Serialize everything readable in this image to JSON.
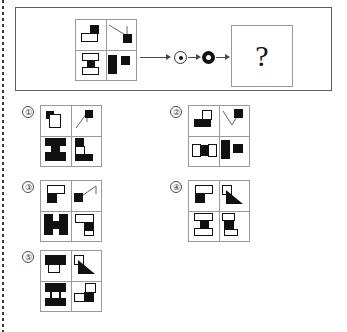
{
  "problem": {
    "panel_name": "problem-panel",
    "answer_placeholder": "?",
    "operators": [
      {
        "name": "ring-dot-icon",
        "label": "ring-dot"
      },
      {
        "name": "filled-disc-icon",
        "label": "filled-disc"
      }
    ],
    "figure": {
      "name": "main-figure",
      "quadrants": [
        {
          "position": "top-left",
          "description": "small black square upper-right over white outlined rectangle"
        },
        {
          "position": "top-right",
          "description": "thin diagonal line descending left-to-right with black square at lower right"
        },
        {
          "position": "bottom-left",
          "description": "white outlined rectangle, black square, white outlined rectangle stacked vertically"
        },
        {
          "position": "bottom-right",
          "description": "tall black rectangle at left with black square at upper right"
        }
      ]
    }
  },
  "options": [
    {
      "number": "①",
      "name": "option-1",
      "quadrants": [
        {
          "position": "top-left",
          "description": "small black square upper-left over white outlined rectangle"
        },
        {
          "position": "top-right",
          "description": "thin diagonal line rising with black square at top right"
        },
        {
          "position": "bottom-left",
          "description": "black I-shape, wide black bars top and bottom with black stem"
        },
        {
          "position": "bottom-right",
          "description": "black square over white rectangle with black bar at bottom right"
        }
      ]
    },
    {
      "number": "②",
      "name": "option-2",
      "quadrants": [
        {
          "position": "top-left",
          "description": "white outlined square upper-right over wide black rectangle"
        },
        {
          "position": "top-right",
          "description": "thin diagonal line descending with black square at top right"
        },
        {
          "position": "bottom-left",
          "description": "white rectangle, black square, white rectangle side by side horizontally"
        },
        {
          "position": "bottom-right",
          "description": "tall black rectangle at left with black square at right"
        }
      ]
    },
    {
      "number": "③",
      "name": "option-3",
      "quadrants": [
        {
          "position": "top-left",
          "description": "white outlined rectangle upper-right over black square"
        },
        {
          "position": "top-right",
          "description": "black square at left with thin diagonal line rising to the right"
        },
        {
          "position": "bottom-left",
          "description": "black H-shape, thick black blocks joined by black bar"
        },
        {
          "position": "bottom-right",
          "description": "white outlined rectangle with black square below right"
        }
      ]
    },
    {
      "number": "④",
      "name": "option-4",
      "quadrants": [
        {
          "position": "top-left",
          "description": "white outlined rectangle upper-right over black square"
        },
        {
          "position": "top-right",
          "description": "white outlined square upper-left with black right triangle"
        },
        {
          "position": "bottom-left",
          "description": "white rectangle, black square, white rectangle stacked vertically"
        },
        {
          "position": "bottom-right",
          "description": "white rectangle top, black square middle, white rectangle bottom offset"
        }
      ]
    },
    {
      "number": "⑤",
      "name": "option-5",
      "quadrants": [
        {
          "position": "top-left",
          "description": "wide black rectangle over white outlined rectangle"
        },
        {
          "position": "top-right",
          "description": "white outlined square upper-left with black right triangle"
        },
        {
          "position": "bottom-left",
          "description": "wide black rectangle top, black bar bottom joined by thin stems"
        },
        {
          "position": "bottom-right",
          "description": "white rectangle upper right, black square with white rectangle at lower left"
        }
      ]
    }
  ]
}
